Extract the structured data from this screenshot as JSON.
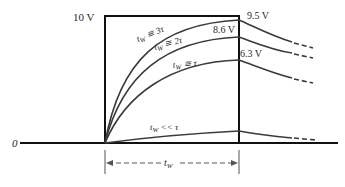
{
  "diagram": {
    "colors": {
      "pulse": "#111111",
      "curve": "#3a3a3a",
      "text": "#2a2a2a",
      "background": "#ffffff"
    },
    "pulse_amplitude_label": "10 V",
    "baseline_label": "0",
    "pulse_width_label": "t",
    "pulse_width_subscript": "W",
    "curves": [
      {
        "id": "tw-3tau",
        "condition_main": "t",
        "condition_sub": "W",
        "condition_rel": " ≅ 3τ",
        "final_value_label": "9.5 V"
      },
      {
        "id": "tw-2tau",
        "condition_main": "t",
        "condition_sub": "W",
        "condition_rel": " ≅ 2τ",
        "final_value_label": "8.6 V"
      },
      {
        "id": "tw-tau",
        "condition_main": "t",
        "condition_sub": "W",
        "condition_rel": " ≅ τ",
        "final_value_label": "6.3 V"
      },
      {
        "id": "tw-ll-tau",
        "condition_main": "t",
        "condition_sub": "W",
        "condition_rel": " << τ",
        "final_value_label": ""
      }
    ]
  }
}
